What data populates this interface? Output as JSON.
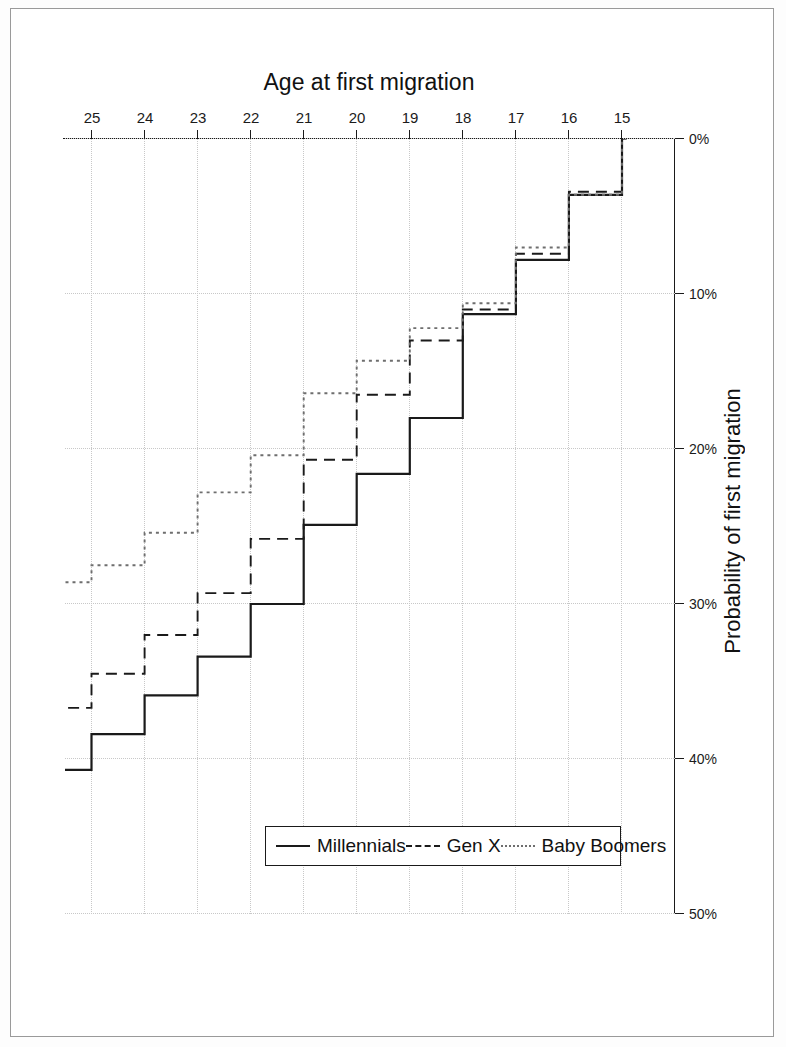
{
  "figure": {
    "background_color": "#ffffff",
    "frame_color": "#9a9a9a",
    "rotation_note": "180"
  },
  "legend": {
    "entries": [
      {
        "label": "Baby Boomers",
        "style": "dotted",
        "color": "#6e6e6e",
        "swatch": "dotted-line-swatch"
      },
      {
        "label": "Gen X",
        "style": "dashed",
        "color": "#1a1a1a",
        "swatch": "dashed-line-swatch"
      },
      {
        "label": "Millennials",
        "style": "solid",
        "color": "#1a1a1a",
        "swatch": "solid-line-swatch"
      }
    ]
  },
  "chart_data": {
    "type": "line",
    "subtype": "step",
    "title": "",
    "xlabel": "Age at first migration",
    "ylabel": "Probability of first migration",
    "x": [
      15,
      16,
      17,
      18,
      19,
      20,
      21,
      22,
      23,
      24,
      25
    ],
    "categories": [
      "15",
      "16",
      "17",
      "18",
      "19",
      "20",
      "21",
      "22",
      "23",
      "24",
      "25"
    ],
    "xlim": [
      14,
      25.5
    ],
    "ylim": [
      0,
      50
    ],
    "xticks": [
      15,
      16,
      17,
      18,
      19,
      20,
      21,
      22,
      23,
      24,
      25
    ],
    "yticks": [
      0,
      10,
      20,
      30,
      40,
      50
    ],
    "ytick_labels": [
      "0%",
      "10%",
      "20%",
      "30%",
      "40%",
      "50%"
    ],
    "y_unit": "%",
    "grid": "dotted-both-axes",
    "legend_position": "upper-left-inside",
    "series": [
      {
        "name": "Millennials",
        "style": "solid",
        "color": "#1a1a1a",
        "values": [
          3.6,
          7.8,
          11.3,
          18.0,
          21.6,
          24.9,
          30.0,
          33.4,
          35.9,
          38.4,
          40.7
        ]
      },
      {
        "name": "Gen X",
        "style": "dashed",
        "color": "#1a1a1a",
        "values": [
          3.4,
          7.4,
          11.0,
          13.0,
          16.5,
          20.7,
          25.8,
          29.3,
          32.0,
          34.5,
          36.7
        ]
      },
      {
        "name": "Baby Boomers",
        "style": "dotted",
        "color": "#6e6e6e",
        "values": [
          3.6,
          7.0,
          10.6,
          12.2,
          14.3,
          16.4,
          20.4,
          22.8,
          25.4,
          27.5,
          28.6
        ]
      }
    ]
  }
}
